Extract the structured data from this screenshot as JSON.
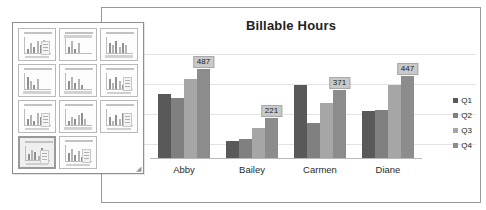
{
  "chart": {
    "title": "Billable Hours",
    "legend_position": "right"
  },
  "legend": [
    {
      "label": "Q1",
      "color": "#595959"
    },
    {
      "label": "Q2",
      "color": "#808080"
    },
    {
      "label": "Q3",
      "color": "#a6a6a6"
    },
    {
      "label": "Q4",
      "color": "#8c8c8c"
    }
  ],
  "gallery": {
    "resize_handle": "◢",
    "thumbnails": [
      {
        "name": "clustered-column",
        "selected": false
      },
      {
        "name": "stacked-column",
        "selected": false
      },
      {
        "name": "100-percent-stacked-column",
        "selected": false
      },
      {
        "name": "clustered-column-no-legend",
        "selected": false
      },
      {
        "name": "clustered-column-with-table",
        "selected": false
      },
      {
        "name": "clustered-column-axis-title",
        "selected": false
      },
      {
        "name": "clustered-column-side-legend",
        "selected": false
      },
      {
        "name": "clustered-column-wide",
        "selected": false
      },
      {
        "name": "clustered-column-gridlines",
        "selected": false
      },
      {
        "name": "clustered-column-data-labels",
        "selected": true
      },
      {
        "name": "clustered-column-plain",
        "selected": false
      }
    ]
  },
  "chart_data": {
    "type": "bar",
    "title": "Billable Hours",
    "xlabel": "",
    "ylabel": "",
    "ylim": [
      0,
      600
    ],
    "grid": true,
    "legend": [
      "Q1",
      "Q2",
      "Q3",
      "Q4"
    ],
    "categories": [
      "Abby",
      "Bailey",
      "Carmen",
      "Diane"
    ],
    "series": [
      {
        "name": "Q1",
        "color": "#595959",
        "values": [
          352,
          96,
          402,
          262
        ]
      },
      {
        "name": "Q2",
        "color": "#808080",
        "values": [
          330,
          110,
          196,
          265
        ]
      },
      {
        "name": "Q3",
        "color": "#a6a6a6",
        "values": [
          432,
          168,
          300,
          398
        ]
      },
      {
        "name": "Q4",
        "color": "#8c8c8c",
        "values": [
          487,
          221,
          371,
          447
        ]
      }
    ],
    "data_labels": [
      {
        "category": "Abby",
        "series": "Q4",
        "value": "487"
      },
      {
        "category": "Bailey",
        "series": "Q4",
        "value": "221"
      },
      {
        "category": "Carmen",
        "series": "Q4",
        "value": "371"
      },
      {
        "category": "Diane",
        "series": "Q4",
        "value": "447"
      }
    ]
  }
}
